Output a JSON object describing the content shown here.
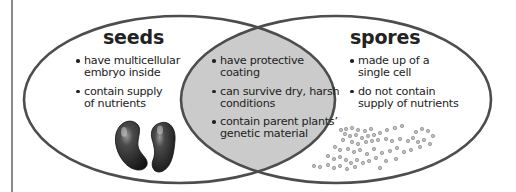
{
  "diagram": {
    "type": "venn",
    "colors": {
      "outline": "#4d4d4d",
      "overlap_fill": "#cbcbcb",
      "background": "#ffffff",
      "bean": "#2a2a2a",
      "spore": "#b8b8b8"
    },
    "left": {
      "title": "seeds",
      "items": [
        {
          "line1": "have multicellular",
          "line2": "embryo inside"
        },
        {
          "line1": "contain supply",
          "line2": "of nutrients"
        }
      ],
      "illustration": "bean-seeds-icon"
    },
    "overlap": {
      "items": [
        {
          "line1": "have protective",
          "line2": "coating"
        },
        {
          "line1": "can survive dry, harsh",
          "line2": "conditions"
        },
        {
          "line1": "contain parent plants’",
          "line2": "genetic material"
        }
      ]
    },
    "right": {
      "title": "spores",
      "items": [
        {
          "line1": "made up of a",
          "line2": "single cell"
        },
        {
          "line1": "do not contain",
          "line2": "supply of nutrients"
        }
      ],
      "illustration": "spores-icon"
    }
  }
}
